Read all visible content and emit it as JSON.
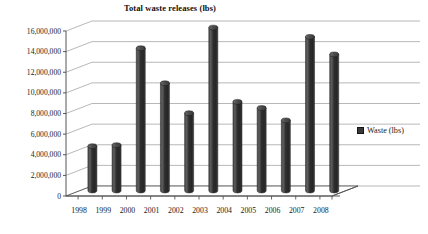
{
  "chart_data": {
    "type": "bar",
    "title": "Total waste releases (lbs)",
    "xlabel": "",
    "ylabel": "",
    "categories": [
      "1998",
      "1999",
      "2000",
      "2001",
      "2002",
      "2003",
      "2004",
      "2005",
      "2006",
      "2007",
      "2008"
    ],
    "series": [
      {
        "name": "Waste (lbs)",
        "values": [
          4300000,
          4400000,
          13800000,
          10400000,
          7500000,
          15800000,
          8600000,
          8000000,
          6800000,
          14900000,
          13200000
        ]
      }
    ],
    "ylim": [
      0,
      16000000
    ],
    "ytick_values": [
      0,
      2000000,
      4000000,
      6000000,
      8000000,
      10000000,
      12000000,
      14000000,
      16000000
    ],
    "ytick_labels": [
      "0",
      "2,000,000",
      "4,000,000",
      "6,000,000",
      "8,000,000",
      "10,000,000",
      "12,000,000",
      "14,000,000",
      "16,000,000"
    ],
    "grid": true,
    "grid_axis": "y",
    "legend_position": "right",
    "style": "3d-cylinder",
    "bar_color": "#3a3a3a",
    "grid_color": "#9a9a9a",
    "axis_color": "#555555",
    "background": "#ffffff"
  },
  "legend": {
    "entries": [
      {
        "label": "Waste (lbs)",
        "color": "#3a3a3a"
      }
    ]
  }
}
